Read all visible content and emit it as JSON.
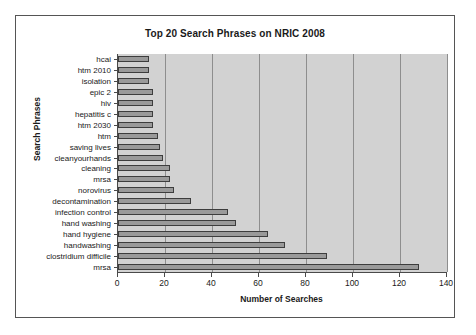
{
  "chart_data": {
    "type": "bar",
    "orientation": "horizontal",
    "title": "Top 20 Search Phrases on NRIC 2008",
    "xlabel": "Number of Searches",
    "ylabel": "Search Phrases",
    "xlim": [
      0,
      140
    ],
    "xticks": [
      0,
      20,
      40,
      60,
      80,
      100,
      120,
      140
    ],
    "grid": "vertical",
    "legend": "none",
    "categories": [
      "hcai",
      "htm 2010",
      "isolation",
      "epic 2",
      "hiv",
      "hepatitis c",
      "htm 2030",
      "htm",
      "saving lives",
      "cleanyourhands",
      "cleaning",
      "mrsa",
      "norovirus",
      "decontamination",
      "infection control",
      "hand washing",
      "hand hygiene",
      "handwashing",
      "clostridium difficile",
      "mrsa"
    ],
    "values": [
      13,
      13,
      13,
      15,
      15,
      15,
      15,
      17,
      18,
      19,
      22,
      22,
      24,
      31,
      47,
      50,
      64,
      71,
      89,
      128
    ],
    "colors": {
      "bar_fill": "#9a9a9a",
      "bar_outline": "#3d3d3d",
      "plot_background": "#d2d2d2",
      "gridline": "#8e8e8e",
      "axis": "#4a4a4a",
      "text": "#1a1a1a",
      "page_background": "#ffffff",
      "frame_border": "#555555"
    }
  }
}
